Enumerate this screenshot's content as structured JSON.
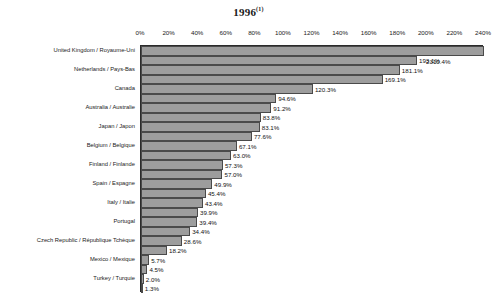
{
  "chart_data": {
    "type": "bar",
    "orientation": "horizontal",
    "title": "1996",
    "title_superscript": "(1)",
    "xlabel": "",
    "ylabel": "",
    "xlim": [
      0,
      240
    ],
    "grid": false,
    "legend": null,
    "axis_unit": "%",
    "tick_labels": [
      "0%",
      "20%",
      "40%",
      "60%",
      "80%",
      "100%",
      "120%",
      "140%",
      "160%",
      "180%",
      "200%",
      "220%",
      "240%"
    ],
    "tick_values": [
      0,
      20,
      40,
      60,
      80,
      100,
      120,
      140,
      160,
      180,
      200,
      220,
      240
    ],
    "bar_color": "#9d9d9d",
    "bar_border_color": "#4a4a4a",
    "axis_color": "#2b2b2b",
    "note": "Top bar value 2310.4% exceeds the axis range and is drawn clipped at the plot edge.",
    "categories": [
      "United Kingdom / Royaume-Uni",
      "",
      "Netherlands / Pays-Bas",
      "",
      "Canada",
      "",
      "Australia / Australie",
      "",
      "Japan / Japon",
      "",
      "Belgium / Belgique",
      "",
      "Finland / Finlande",
      "",
      "Spain / Espagne",
      "",
      "Italy / Italie",
      "",
      "Portugal",
      "",
      "Czech Republic / République Tchèque",
      "",
      "Mexico / Mexique",
      "",
      "Turkey / Turquie",
      ""
    ],
    "values": [
      2310.4,
      193.1,
      181.1,
      169.1,
      120.3,
      94.6,
      91.2,
      83.8,
      83.1,
      77.6,
      67.1,
      63.0,
      57.3,
      57.0,
      49.9,
      45.4,
      43.4,
      39.9,
      39.4,
      34.4,
      28.6,
      18.2,
      5.7,
      4.5,
      2.0,
      1.3
    ],
    "value_labels": [
      "2310.4%",
      "193.1%",
      "181.1%",
      "169.1%",
      "120.3%",
      "94.6%",
      "91.2%",
      "83.8%",
      "83.1%",
      "77.6%",
      "67.1%",
      "63.0%",
      "57.3%",
      "57.0%",
      "49.9%",
      "45.4%",
      "43.4%",
      "39.9%",
      "39.4%",
      "34.4%",
      "28.6%",
      "18.2%",
      "5.7%",
      "4.5%",
      "2.0%",
      "1.3%"
    ]
  }
}
